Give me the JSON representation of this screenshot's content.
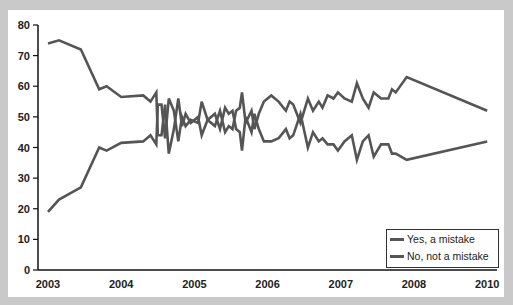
{
  "chart_data": {
    "type": "line",
    "title": "",
    "xlabel": "",
    "ylabel": "",
    "ylim": [
      0,
      80
    ],
    "yticks": [
      0,
      10,
      20,
      30,
      40,
      50,
      60,
      70,
      80
    ],
    "xticks": [
      {
        "label": "2003",
        "pos": 2003
      },
      {
        "label": "2004",
        "pos": 2004
      },
      {
        "label": "2005",
        "pos": 2005
      },
      {
        "label": "2006",
        "pos": 2006
      },
      {
        "label": "2007",
        "pos": 2007
      },
      {
        "label": "2008",
        "pos": 2008
      },
      {
        "label": "2010",
        "pos": 2009
      }
    ],
    "xlim": [
      2002.85,
      2009.05
    ],
    "grid": false,
    "legend_position": "lower right",
    "line_color": "#555555",
    "series": [
      {
        "name": "Yes, a mistake",
        "points": [
          [
            2003.0,
            19
          ],
          [
            2003.15,
            23
          ],
          [
            2003.45,
            27
          ],
          [
            2003.7,
            40
          ],
          [
            2003.8,
            39
          ],
          [
            2004.0,
            41.5
          ],
          [
            2004.3,
            42
          ],
          [
            2004.4,
            44
          ],
          [
            2004.48,
            41
          ],
          [
            2004.5,
            54
          ],
          [
            2004.55,
            54
          ],
          [
            2004.6,
            43
          ],
          [
            2004.65,
            56
          ],
          [
            2004.72,
            52
          ],
          [
            2004.78,
            42
          ],
          [
            2004.83,
            50
          ],
          [
            2004.88,
            47
          ],
          [
            2004.95,
            49
          ],
          [
            2005.05,
            48
          ],
          [
            2005.1,
            55
          ],
          [
            2005.18,
            49
          ],
          [
            2005.28,
            47
          ],
          [
            2005.35,
            52
          ],
          [
            2005.42,
            45
          ],
          [
            2005.47,
            47
          ],
          [
            2005.52,
            46
          ],
          [
            2005.57,
            52
          ],
          [
            2005.62,
            53
          ],
          [
            2005.65,
            58
          ],
          [
            2005.7,
            48
          ],
          [
            2005.78,
            52
          ],
          [
            2005.82,
            46
          ],
          [
            2005.88,
            51
          ],
          [
            2005.95,
            55
          ],
          [
            2006.05,
            57
          ],
          [
            2006.15,
            55
          ],
          [
            2006.25,
            52
          ],
          [
            2006.3,
            55
          ],
          [
            2006.35,
            54
          ],
          [
            2006.45,
            48
          ],
          [
            2006.55,
            56
          ],
          [
            2006.62,
            52
          ],
          [
            2006.7,
            55
          ],
          [
            2006.75,
            53
          ],
          [
            2006.82,
            57
          ],
          [
            2006.9,
            56
          ],
          [
            2006.96,
            58
          ],
          [
            2007.05,
            56
          ],
          [
            2007.15,
            55
          ],
          [
            2007.22,
            61
          ],
          [
            2007.3,
            56
          ],
          [
            2007.38,
            53
          ],
          [
            2007.45,
            58
          ],
          [
            2007.55,
            56
          ],
          [
            2007.65,
            56
          ],
          [
            2007.7,
            59
          ],
          [
            2007.75,
            58
          ],
          [
            2007.9,
            63
          ],
          [
            2009.0,
            52
          ]
        ]
      },
      {
        "name": "No, not a mistake",
        "points": [
          [
            2003.0,
            74
          ],
          [
            2003.15,
            75
          ],
          [
            2003.45,
            72
          ],
          [
            2003.7,
            59
          ],
          [
            2003.8,
            60
          ],
          [
            2004.0,
            56.5
          ],
          [
            2004.3,
            57
          ],
          [
            2004.4,
            55
          ],
          [
            2004.48,
            58
          ],
          [
            2004.5,
            44
          ],
          [
            2004.55,
            44
          ],
          [
            2004.6,
            54
          ],
          [
            2004.65,
            38
          ],
          [
            2004.72,
            46
          ],
          [
            2004.78,
            56
          ],
          [
            2004.83,
            47
          ],
          [
            2004.88,
            51
          ],
          [
            2004.95,
            48
          ],
          [
            2005.05,
            50
          ],
          [
            2005.1,
            44
          ],
          [
            2005.18,
            49
          ],
          [
            2005.28,
            51
          ],
          [
            2005.35,
            46
          ],
          [
            2005.42,
            53
          ],
          [
            2005.47,
            51
          ],
          [
            2005.52,
            52
          ],
          [
            2005.57,
            46
          ],
          [
            2005.62,
            45
          ],
          [
            2005.65,
            39
          ],
          [
            2005.7,
            50
          ],
          [
            2005.78,
            45
          ],
          [
            2005.82,
            51
          ],
          [
            2005.88,
            46
          ],
          [
            2005.95,
            42
          ],
          [
            2006.05,
            42
          ],
          [
            2006.15,
            43
          ],
          [
            2006.25,
            46
          ],
          [
            2006.3,
            43
          ],
          [
            2006.35,
            44
          ],
          [
            2006.45,
            51
          ],
          [
            2006.55,
            40
          ],
          [
            2006.62,
            45
          ],
          [
            2006.7,
            42
          ],
          [
            2006.75,
            43
          ],
          [
            2006.82,
            41
          ],
          [
            2006.9,
            41
          ],
          [
            2006.96,
            39
          ],
          [
            2007.05,
            42
          ],
          [
            2007.15,
            44
          ],
          [
            2007.22,
            36
          ],
          [
            2007.3,
            42
          ],
          [
            2007.38,
            44
          ],
          [
            2007.45,
            37
          ],
          [
            2007.55,
            41
          ],
          [
            2007.65,
            41
          ],
          [
            2007.7,
            38
          ],
          [
            2007.75,
            38
          ],
          [
            2007.9,
            36
          ],
          [
            2009.0,
            42
          ]
        ]
      }
    ]
  },
  "legend": {
    "items": [
      "Yes, a mistake",
      "No, not a mistake"
    ]
  }
}
